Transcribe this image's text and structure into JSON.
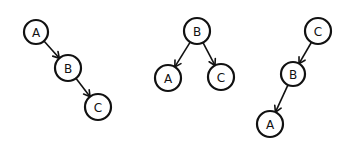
{
  "diagram": {
    "trees": [
      {
        "name": "tree-1",
        "nodes": [
          {
            "id": "A",
            "label": "A",
            "x": 36,
            "y": 32,
            "r": 12
          },
          {
            "id": "B",
            "label": "B",
            "x": 68,
            "y": 68,
            "r": 13
          },
          {
            "id": "C",
            "label": "C",
            "x": 98,
            "y": 107,
            "r": 13
          }
        ],
        "edges": [
          {
            "from": "A",
            "to": "B"
          },
          {
            "from": "B",
            "to": "C"
          }
        ]
      },
      {
        "name": "tree-2",
        "nodes": [
          {
            "id": "B",
            "label": "B",
            "x": 197,
            "y": 31,
            "r": 13
          },
          {
            "id": "A",
            "label": "A",
            "x": 168,
            "y": 78,
            "r": 13
          },
          {
            "id": "C",
            "label": "C",
            "x": 221,
            "y": 77,
            "r": 13
          }
        ],
        "edges": [
          {
            "from": "B",
            "to": "A"
          },
          {
            "from": "B",
            "to": "C"
          }
        ]
      },
      {
        "name": "tree-3",
        "nodes": [
          {
            "id": "C",
            "label": "C",
            "x": 318,
            "y": 31,
            "r": 13
          },
          {
            "id": "B",
            "label": "B",
            "x": 293,
            "y": 74,
            "r": 12
          },
          {
            "id": "A",
            "label": "A",
            "x": 270,
            "y": 124,
            "r": 13
          }
        ],
        "edges": [
          {
            "from": "C",
            "to": "B"
          },
          {
            "from": "B",
            "to": "A"
          }
        ]
      }
    ]
  }
}
